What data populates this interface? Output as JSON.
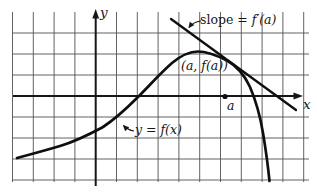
{
  "labels": {
    "y_axis": "y",
    "x_axis": "x",
    "point_abscissa": "a",
    "tangent_point": "(a, f(a))",
    "curve": "y = f(x)",
    "slope_prefix": "slope = ",
    "slope_value": "f′(a)"
  },
  "geometry": {
    "curve_path": "M 17 158 C 30 154.5 45 150.5 60 146 C 78 140.5 90 134 103 127 C 116 118.5 126 109 138 97 C 150 85 160 73.5 172 63 C 181 55.5 190 51.5 198 51.5 C 208 51.5 218 56 227 60.5 C 236 65.5 244 74 250 87 C 256 101 260 115 263 133 C 266 151 268 166 269.5 181",
    "tangent_path": "M 171 19 L 296 110",
    "slope_arrow_path": "M 201 21 Q 193 22 189 27.5",
    "curve_arrow_path": "M 134 131 Q 128 130 123.5 125.5",
    "point_a_dot_path": "M 225 96.5 m -2.6 0 a 2.6 2.6 0 1 0 5.2 0 a 2.6 2.6 0 1 0 -5.2 0"
  },
  "colors": {
    "ink": "#161616",
    "grid": "#515151",
    "background": "#ffffff"
  }
}
